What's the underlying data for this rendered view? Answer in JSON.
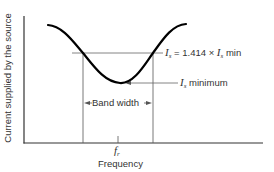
{
  "diagram": {
    "y_axis_label": "Current supplied by the source",
    "x_axis_label": "Frequency",
    "resonant_freq": {
      "symbol": "f",
      "subscript": "r"
    },
    "annotation_half_power": {
      "lhs": "I",
      "lhs_sub": "s",
      "rhs_prefix": "= 1.414 ×",
      "rhs_var": "I",
      "rhs_sub": "s",
      "rhs_suffix": "min"
    },
    "annotation_minimum": {
      "var": "I",
      "sub": "s",
      "text": "minimum"
    },
    "band_width_label": "Band width",
    "colors": {
      "curve": "#000000",
      "lines": "#444444",
      "text": "#333333"
    }
  }
}
